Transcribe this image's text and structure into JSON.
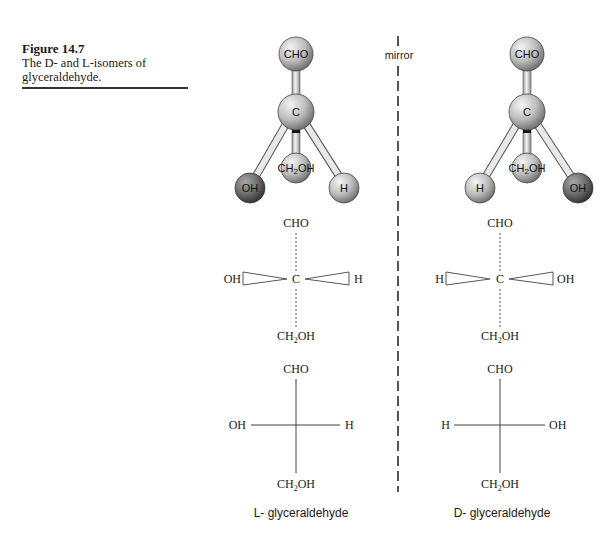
{
  "caption": {
    "figure_number": "Figure 14.7",
    "text_line1": "The D- and L-isomers of",
    "text_line2": "glyceraldehyde."
  },
  "mirror_label": "mirror",
  "left_isomer": {
    "name": "L- glyceraldehyde",
    "ball_stick": {
      "top": "CHO",
      "center": "C",
      "back": "CH2OH",
      "left": "OH",
      "right": "H"
    },
    "wedge_projection": {
      "top": "CHO",
      "center": "C",
      "bottom": "CH2OH",
      "left": "OH",
      "right": "H"
    },
    "fischer_projection": {
      "top": "CHO",
      "bottom": "CH2OH",
      "left": "OH",
      "right": "H"
    }
  },
  "right_isomer": {
    "name": "D- glyceraldehyde",
    "ball_stick": {
      "top": "CHO",
      "center": "C",
      "back": "CH2OH",
      "left": "H",
      "right": "OH"
    },
    "wedge_projection": {
      "top": "CHO",
      "center": "C",
      "bottom": "CH2OH",
      "left": "H",
      "right": "OH"
    },
    "fischer_projection": {
      "top": "CHO",
      "bottom": "CH2OH",
      "left": "H",
      "right": "OH"
    }
  },
  "colors": {
    "light_atom": "#c8c8c8",
    "dark_atom": "#6e6e6e",
    "bond": "#e6e6e6"
  }
}
